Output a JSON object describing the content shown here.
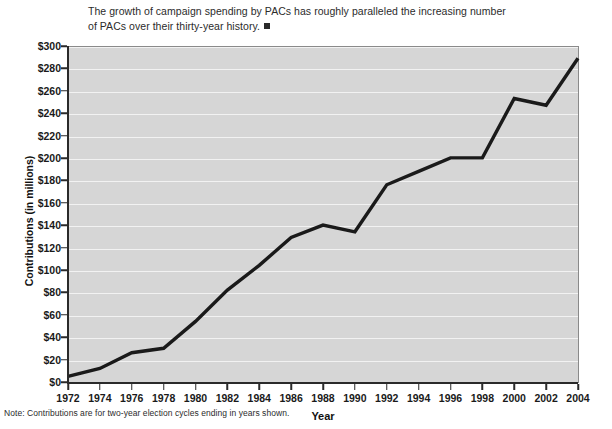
{
  "caption": {
    "text": "The growth of campaign spending by PACs has roughly paralleled the increasing number of PACs over their thirty-year history.",
    "end_marker": "filled-square"
  },
  "footnote": {
    "text": "Note: Contributions are for two-year election cycles ending in years shown."
  },
  "colors": {
    "plot_background": "#d6d6d6",
    "gridline": "#f2f2f2",
    "line": "#1a1a1a",
    "axis": "#2a2a2a",
    "text": "#1a1a1a"
  },
  "chart_data": {
    "type": "line",
    "title": "",
    "xlabel": "Year",
    "ylabel": "Contributions (in millions)",
    "x": [
      1972,
      1974,
      1976,
      1978,
      1980,
      1982,
      1984,
      1986,
      1988,
      1990,
      1992,
      1994,
      1996,
      1998,
      2000,
      2002,
      2004
    ],
    "xtick_labels": [
      "1972",
      "1974",
      "1976",
      "1978",
      "1980",
      "1982",
      "1984",
      "1986",
      "1988",
      "1990",
      "1992",
      "1994",
      "1996",
      "1998",
      "2000",
      "2002",
      "2004"
    ],
    "values": [
      6,
      13,
      27,
      31,
      55,
      83,
      105,
      130,
      141,
      135,
      177,
      189,
      201,
      201,
      254,
      248,
      290
    ],
    "ytick_values": [
      0,
      20,
      40,
      60,
      80,
      100,
      120,
      140,
      160,
      180,
      200,
      220,
      240,
      260,
      280,
      300
    ],
    "ytick_labels": [
      "$0",
      "$20",
      "$40",
      "$60",
      "$80",
      "$100",
      "$120",
      "$140",
      "$160",
      "$180",
      "$200",
      "$220",
      "$240",
      "$260",
      "$280",
      "$300"
    ],
    "ylim": [
      0,
      300
    ],
    "xlim": [
      1972,
      2004
    ],
    "grid": true,
    "legend": false,
    "series": [
      {
        "name": "PAC contributions",
        "values": [
          6,
          13,
          27,
          31,
          55,
          83,
          105,
          130,
          141,
          135,
          177,
          189,
          201,
          201,
          254,
          248,
          290
        ]
      }
    ]
  }
}
